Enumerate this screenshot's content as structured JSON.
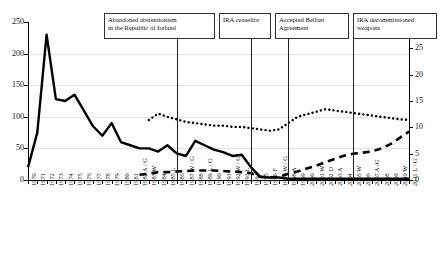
{
  "chart_data": {
    "type": "line",
    "title": "",
    "xlabel": "",
    "ylabel": "",
    "ylim": [
      0,
      250
    ],
    "y2lim": [
      0,
      30
    ],
    "grid": true,
    "legend": "none",
    "yticks": [
      0,
      50,
      100,
      150,
      200,
      250
    ],
    "y2ticks": [
      0,
      5,
      10,
      15,
      20,
      25,
      30
    ],
    "categories": [
      "1970",
      "1971",
      "1972",
      "1973",
      "1974",
      "1975",
      "1976",
      "1977",
      "1978",
      "1979",
      "1980",
      "1981",
      "1982 A / G",
      "1983 W",
      "1984",
      "1985 L",
      "1986",
      "1987 W / G",
      "1988",
      "1989 L / G",
      "1990",
      "1991",
      "1992 W / G",
      "1993 L",
      "1994",
      "1995",
      "1996 F",
      "1997 W / G",
      "1998 A",
      "1999",
      "2000",
      "2001 W",
      "2002 D",
      "2003 A",
      "2004",
      "2005 W",
      "2006",
      "2007 A /G",
      "2008",
      "2009",
      "2010 W",
      "2011 L / G"
    ],
    "series": [
      {
        "name": "deaths-solid",
        "style": "solid",
        "axis": "left",
        "values": [
          20,
          75,
          230,
          128,
          125,
          135,
          110,
          85,
          70,
          90,
          60,
          55,
          50,
          50,
          45,
          55,
          42,
          38,
          62,
          55,
          48,
          44,
          38,
          40,
          20,
          5,
          4,
          4,
          2,
          2,
          2,
          2,
          2,
          2,
          2,
          2,
          2,
          2,
          2,
          2,
          2,
          2
        ]
      },
      {
        "name": "dotted-upper",
        "style": "dotted",
        "axis": "left",
        "values": [
          null,
          null,
          null,
          null,
          null,
          null,
          null,
          null,
          null,
          null,
          null,
          null,
          null,
          95,
          105,
          100,
          96,
          92,
          90,
          88,
          86,
          86,
          84,
          84,
          82,
          80,
          78,
          80,
          90,
          100,
          104,
          108,
          112,
          110,
          108,
          106,
          104,
          102,
          100,
          98,
          96,
          95
        ]
      },
      {
        "name": "dashed-right-axis",
        "style": "dashed",
        "axis": "right",
        "values": [
          null,
          null,
          null,
          null,
          null,
          null,
          null,
          null,
          null,
          null,
          null,
          null,
          1.0,
          1.2,
          1.5,
          1.5,
          1.6,
          1.7,
          1.8,
          1.8,
          1.8,
          1.7,
          1.6,
          1.5,
          1.3,
          0.6,
          0.5,
          0.6,
          1.2,
          1.6,
          2.2,
          2.7,
          3.4,
          4.0,
          4.6,
          5.0,
          5.2,
          5.4,
          6.0,
          6.8,
          8.0,
          9.2
        ]
      }
    ],
    "annotations": [
      {
        "id": "ann-abstentionism",
        "label": "Abandoned abstentionism in the Republic of Ireland",
        "line1": "Abandoned abstentionism",
        "line2": "in the Republic of Ireland",
        "at_category": "1986"
      },
      {
        "id": "ann-ceasefire",
        "label": "IRA ceasefire",
        "line1": "IRA ceasefire",
        "line2": "",
        "at_category": "1994"
      },
      {
        "id": "ann-belfast",
        "label": "Accepted Belfast Agreement",
        "line1": "Accepted Belfast",
        "line2": "Agreement",
        "at_category": "1998 A"
      },
      {
        "id": "ann-decommissioned",
        "label": "IRA decommissioned weapons",
        "line1": "IRA decommissioned",
        "line2": "weapons",
        "at_category": "2005 W"
      }
    ]
  }
}
